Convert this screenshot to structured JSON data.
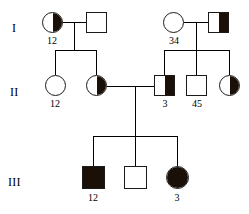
{
  "figure": {
    "type": "pedigree-chart",
    "background_color": "#ffffff",
    "stroke_color": "#1a1a1a",
    "fill_color": "#1a1008"
  },
  "generations": [
    {
      "id": "I",
      "label": "I"
    },
    {
      "id": "II",
      "label": "II"
    },
    {
      "id": "III",
      "label": "III"
    }
  ],
  "individuals": {
    "i1": {
      "shape": "circle",
      "fill": "half-right",
      "number": "12"
    },
    "i2": {
      "shape": "square",
      "fill": "none",
      "number": ""
    },
    "i3": {
      "shape": "circle",
      "fill": "none",
      "number": "34"
    },
    "i4": {
      "shape": "square",
      "fill": "half-right",
      "number": ""
    },
    "ii1": {
      "shape": "circle",
      "fill": "none",
      "number": "12"
    },
    "ii2": {
      "shape": "circle",
      "fill": "half-right",
      "number": ""
    },
    "ii3": {
      "shape": "square",
      "fill": "half-right",
      "number": "3"
    },
    "ii4": {
      "shape": "square",
      "fill": "none",
      "number": "45"
    },
    "ii5": {
      "shape": "circle",
      "fill": "half-right",
      "number": ""
    },
    "iii1": {
      "shape": "square",
      "fill": "full",
      "number": "12"
    },
    "iii2": {
      "shape": "square",
      "fill": "none",
      "number": ""
    },
    "iii3": {
      "shape": "circle",
      "fill": "full",
      "number": "3"
    }
  }
}
